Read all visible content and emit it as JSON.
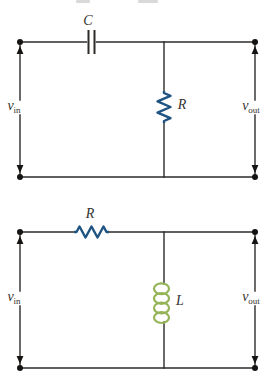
{
  "figure": {
    "top_circuit": {
      "description": "series capacitor with shunt resistor between input and output terminals",
      "series_component_label": "C",
      "shunt_component_label": "R",
      "input_label": {
        "base": "v",
        "sub": "in"
      },
      "output_label": {
        "base": "v",
        "sub": "out"
      }
    },
    "bottom_circuit": {
      "description": "series resistor with shunt inductor between input and output terminals",
      "series_component_label": "R",
      "shunt_component_label": "L",
      "input_label": {
        "base": "v",
        "sub": "in"
      },
      "output_label": {
        "base": "v",
        "sub": "out"
      }
    },
    "colors": {
      "background": "#ffffff",
      "wire": "#2d2b29",
      "node": "#161412",
      "resistor": "#1e5382",
      "inductor": "#95b457",
      "label": "#33312e"
    }
  }
}
